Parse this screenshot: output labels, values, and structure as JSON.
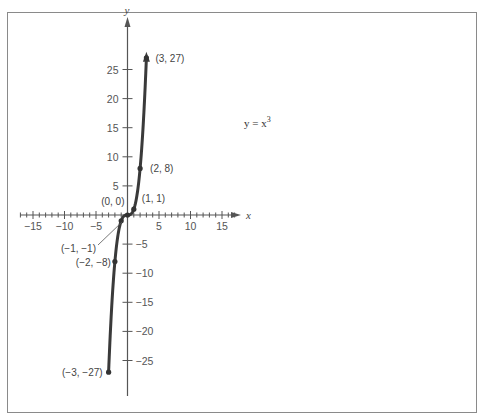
{
  "figure": {
    "frame_color": "#8a8a8a",
    "axis_color": "#555555",
    "curve_color": "#3a3a3a",
    "equation_text": "y = x",
    "equation_exponent": "3",
    "x_axis_name": "x",
    "y_axis_name": "y"
  },
  "chart_data": {
    "type": "line",
    "title": "",
    "function": "y = x^3",
    "xlabel": "x",
    "ylabel": "y",
    "xlim": [
      -17,
      17
    ],
    "ylim": [
      -27,
      27
    ],
    "grid": false,
    "x_ticks": [
      -15,
      -10,
      -5,
      5,
      10,
      15
    ],
    "x_tick_labels": [
      "−15",
      "−10",
      "−5",
      "5",
      "10",
      "15"
    ],
    "y_ticks": [
      25,
      20,
      15,
      10,
      5,
      -5,
      -10,
      -15,
      -20,
      -25
    ],
    "y_tick_labels": [
      "25",
      "20",
      "15",
      "10",
      "5",
      "−5",
      "−10",
      "−15",
      "−20",
      "−25"
    ],
    "x_minor_tick_step": 1,
    "series": [
      {
        "name": "y = x^3",
        "x": [
          -3,
          -2,
          -1,
          0,
          1,
          2,
          3
        ],
        "y": [
          -27,
          -8,
          -1,
          0,
          1,
          8,
          27
        ]
      }
    ],
    "annotations": [
      {
        "label": "(3, 27)",
        "x": 3,
        "y": 27
      },
      {
        "label": "(2, 8)",
        "x": 2,
        "y": 8
      },
      {
        "label": "(1, 1)",
        "x": 1,
        "y": 1
      },
      {
        "label": "(0, 0)",
        "x": 0,
        "y": 0
      },
      {
        "label": "(−1, −1)",
        "x": -1,
        "y": -1
      },
      {
        "label": "(−2, −8)",
        "x": -2,
        "y": -8
      },
      {
        "label": "(−3, −27)",
        "x": -3,
        "y": -27
      }
    ]
  }
}
